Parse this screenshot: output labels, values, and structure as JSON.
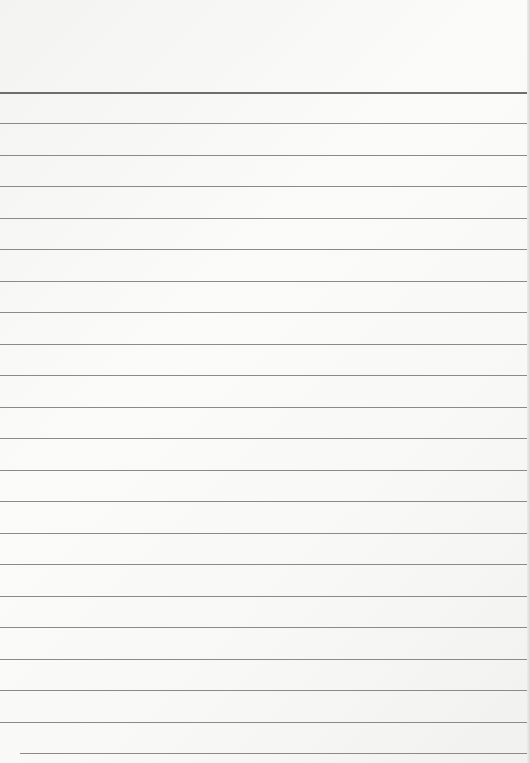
{
  "page": {
    "type": "lined-paper",
    "background_color": "#f8f8f6",
    "line_color": "#8a8a88",
    "lines": [
      {
        "y": 92,
        "x": 0
      },
      {
        "y": 123,
        "x": 0
      },
      {
        "y": 155,
        "x": 0
      },
      {
        "y": 186,
        "x": 0
      },
      {
        "y": 218,
        "x": 0
      },
      {
        "y": 249,
        "x": 0
      },
      {
        "y": 281,
        "x": 0
      },
      {
        "y": 312,
        "x": 0
      },
      {
        "y": 344,
        "x": 0
      },
      {
        "y": 375,
        "x": 0
      },
      {
        "y": 407,
        "x": 0
      },
      {
        "y": 438,
        "x": 0
      },
      {
        "y": 470,
        "x": 0
      },
      {
        "y": 501,
        "x": 0
      },
      {
        "y": 533,
        "x": 0
      },
      {
        "y": 564,
        "x": 0
      },
      {
        "y": 596,
        "x": 0
      },
      {
        "y": 627,
        "x": 0
      },
      {
        "y": 659,
        "x": 0
      },
      {
        "y": 690,
        "x": 0
      },
      {
        "y": 722,
        "x": 0
      },
      {
        "y": 753,
        "x": 20
      }
    ]
  }
}
